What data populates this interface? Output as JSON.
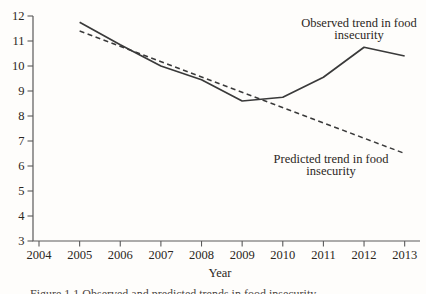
{
  "figure": {
    "background": "#fefdfb",
    "line_color": "#3a3a3a",
    "axis_color": "#5a5a5a",
    "text_color": "#2b2622"
  },
  "chart_data": {
    "type": "line",
    "title": "",
    "xlabel": "Year",
    "ylabel": "",
    "xlim": [
      2004,
      2013
    ],
    "ylim": [
      3,
      12
    ],
    "grid": false,
    "legend_position": "none",
    "x_ticks": [
      2004,
      2005,
      2006,
      2007,
      2008,
      2009,
      2010,
      2011,
      2012,
      2013
    ],
    "y_ticks": [
      3,
      4,
      5,
      6,
      7,
      8,
      9,
      10,
      11,
      12
    ],
    "series": [
      {
        "name": "Observed trend in food insecurity",
        "style": "solid",
        "x": [
          2005,
          2006,
          2007,
          2008,
          2009,
          2010,
          2011,
          2012,
          2013
        ],
        "values": [
          11.75,
          10.85,
          10.0,
          9.45,
          8.6,
          8.75,
          9.55,
          10.75,
          10.4
        ]
      },
      {
        "name": "Predicted trend in food insecurity",
        "style": "dashed",
        "x": [
          2005,
          2013
        ],
        "values": [
          11.4,
          6.5
        ]
      }
    ],
    "annotations": [
      {
        "text": "Observed trend in food insecurity",
        "anchor": "observed-line"
      },
      {
        "text": "Predicted trend in food insecurity",
        "anchor": "predicted-line"
      }
    ]
  },
  "caption_partial": "Figure 1.1 Observed and predicted trends in food insecurity"
}
